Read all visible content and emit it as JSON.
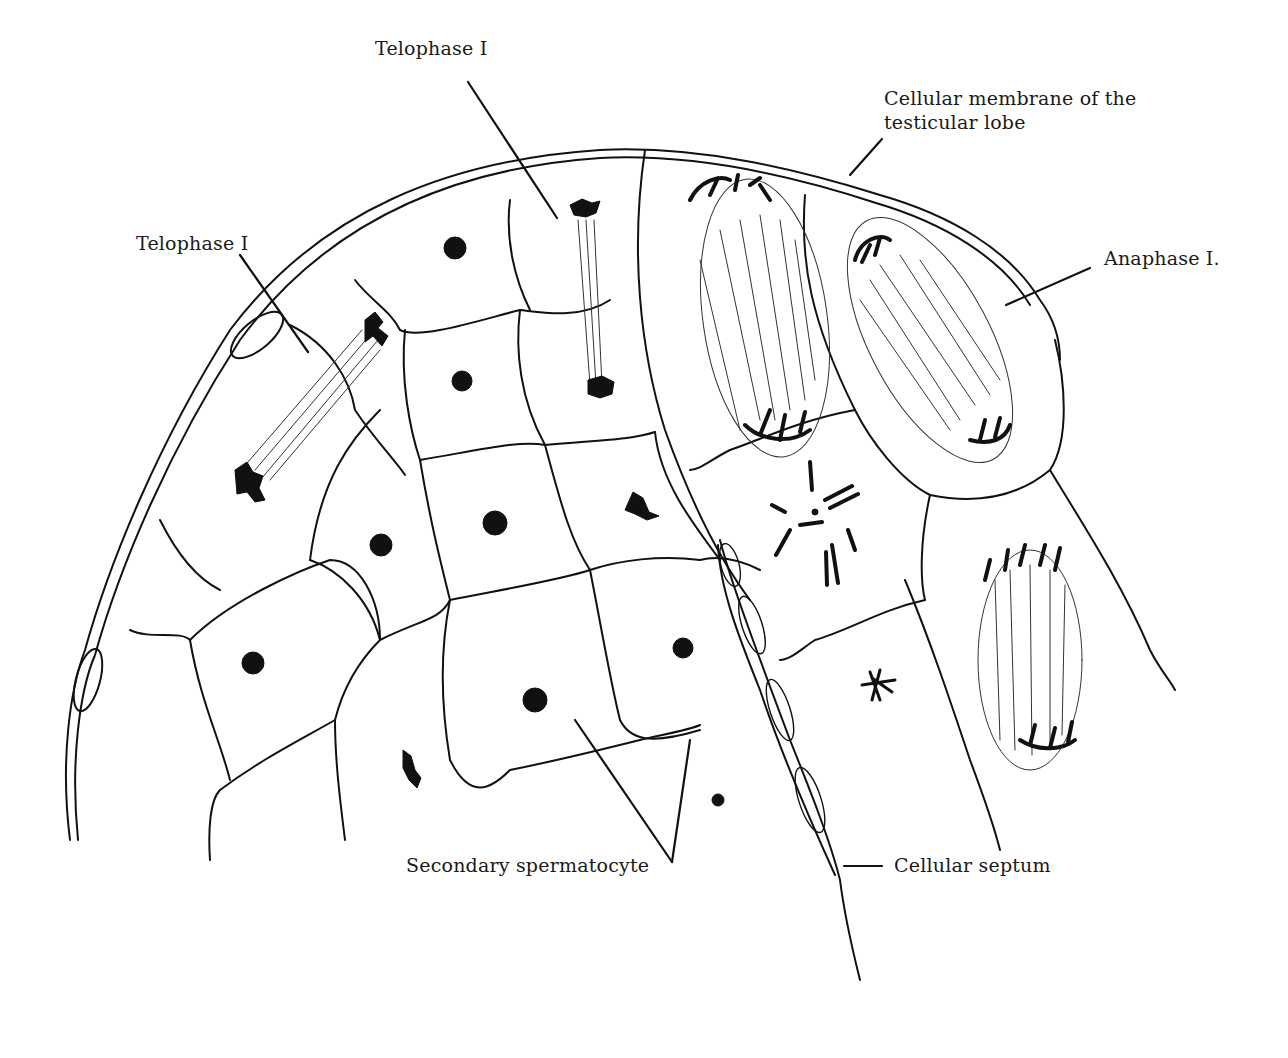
{
  "figure": {
    "type": "line-drawing",
    "background": "#ffffff",
    "ink_color": "#111111"
  },
  "labels": {
    "telophase_top": "Telophase I",
    "telophase_left": "Telophase I",
    "membrane_line1": "Cellular membrane of the",
    "membrane_line2": "testicular lobe",
    "anaphase": "Anaphase I.",
    "secondary_spermatocyte": "Secondary spermatocyte",
    "cellular_septum": "Cellular septum"
  }
}
